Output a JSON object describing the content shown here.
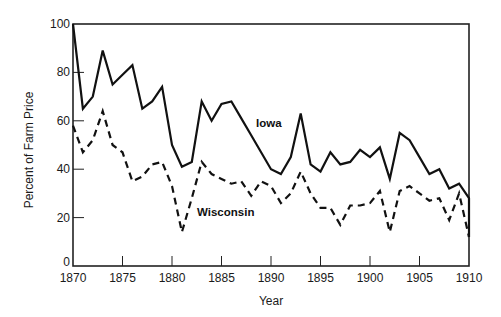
{
  "chart_data": {
    "type": "line",
    "title": "",
    "xlabel": "Year",
    "ylabel": "Percent of Farm Price",
    "xlim": [
      1870,
      1910
    ],
    "ylim": [
      0,
      100
    ],
    "x_ticks": [
      1870,
      1875,
      1880,
      1885,
      1890,
      1895,
      1900,
      1905,
      1910
    ],
    "y_ticks": [
      0,
      20,
      40,
      60,
      80,
      100
    ],
    "grid": false,
    "legend": "inline labels",
    "series": [
      {
        "name": "Iowa",
        "style": "solid",
        "color": "#111111",
        "label_pos": {
          "x": 256,
          "y": 127
        },
        "points": [
          [
            1870,
            100
          ],
          [
            1871,
            65
          ],
          [
            1872,
            70
          ],
          [
            1873,
            89
          ],
          [
            1874,
            75
          ],
          [
            1875,
            79
          ],
          [
            1876,
            83
          ],
          [
            1877,
            65
          ],
          [
            1878,
            68
          ],
          [
            1879,
            74
          ],
          [
            1880,
            50
          ],
          [
            1881,
            41
          ],
          [
            1882,
            43
          ],
          [
            1883,
            68
          ],
          [
            1884,
            60
          ],
          [
            1885,
            67
          ],
          [
            1886,
            68
          ],
          [
            1887,
            61
          ],
          [
            1888,
            54
          ],
          [
            1889,
            47
          ],
          [
            1890,
            40
          ],
          [
            1891,
            38
          ],
          [
            1892,
            45
          ],
          [
            1893,
            63
          ],
          [
            1894,
            42
          ],
          [
            1895,
            39
          ],
          [
            1896,
            47
          ],
          [
            1897,
            42
          ],
          [
            1898,
            43
          ],
          [
            1899,
            48
          ],
          [
            1900,
            45
          ],
          [
            1901,
            49
          ],
          [
            1902,
            36
          ],
          [
            1903,
            55
          ],
          [
            1904,
            52
          ],
          [
            1905,
            45
          ],
          [
            1906,
            38
          ],
          [
            1907,
            40
          ],
          [
            1908,
            32
          ],
          [
            1909,
            34
          ],
          [
            1910,
            28
          ],
          [
            1910,
            12
          ]
        ]
      },
      {
        "name": "Wisconsin",
        "style": "dashed",
        "color": "#111111",
        "label_pos": {
          "x": 197,
          "y": 216
        },
        "points": [
          [
            1870,
            58
          ],
          [
            1871,
            47
          ],
          [
            1872,
            52
          ],
          [
            1873,
            64
          ],
          [
            1874,
            50
          ],
          [
            1875,
            47
          ],
          [
            1876,
            35
          ],
          [
            1877,
            37
          ],
          [
            1878,
            42
          ],
          [
            1879,
            43
          ],
          [
            1880,
            33
          ],
          [
            1881,
            14
          ],
          [
            1882,
            28
          ],
          [
            1883,
            43
          ],
          [
            1884,
            38
          ],
          [
            1885,
            36
          ],
          [
            1886,
            34
          ],
          [
            1887,
            35
          ],
          [
            1888,
            29
          ],
          [
            1889,
            35
          ],
          [
            1890,
            33
          ],
          [
            1891,
            26
          ],
          [
            1892,
            30
          ],
          [
            1893,
            39
          ],
          [
            1894,
            30
          ],
          [
            1895,
            24
          ],
          [
            1896,
            24
          ],
          [
            1897,
            17
          ],
          [
            1898,
            25
          ],
          [
            1899,
            25
          ],
          [
            1900,
            26
          ],
          [
            1901,
            31
          ],
          [
            1902,
            14
          ],
          [
            1903,
            31
          ],
          [
            1904,
            33
          ],
          [
            1905,
            30
          ],
          [
            1906,
            27
          ],
          [
            1907,
            28
          ],
          [
            1908,
            19
          ],
          [
            1909,
            30
          ],
          [
            1910,
            12
          ]
        ]
      }
    ]
  },
  "layout": {
    "plot": {
      "left": 73,
      "right": 469,
      "top": 24,
      "bottom": 266
    }
  }
}
